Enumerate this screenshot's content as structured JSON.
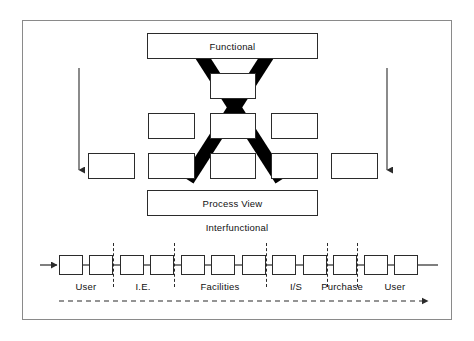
{
  "figure": {
    "type": "diagram",
    "width": 474,
    "height": 341,
    "background_color": "#ffffff",
    "frame_border_color": "#8a8a8a",
    "line_color": "#2b2b2b",
    "cross_out_color": "#000000"
  },
  "top_section": {
    "title_box": {
      "label": "Functional",
      "x": 147,
      "y": 33,
      "width": 171,
      "height": 26
    },
    "hierarchy_rows": [
      {
        "row": 1,
        "boxes": [
          {
            "x": 210,
            "y": 73,
            "width": 46,
            "height": 26
          }
        ]
      },
      {
        "row": 2,
        "boxes": [
          {
            "x": 148,
            "y": 113,
            "width": 47,
            "height": 26
          },
          {
            "x": 210,
            "y": 113,
            "width": 46,
            "height": 26
          },
          {
            "x": 271,
            "y": 113,
            "width": 47,
            "height": 26
          }
        ]
      },
      {
        "row": 3,
        "boxes": [
          {
            "x": 88,
            "y": 153,
            "width": 47,
            "height": 26
          },
          {
            "x": 148,
            "y": 153,
            "width": 47,
            "height": 26
          },
          {
            "x": 210,
            "y": 153,
            "width": 46,
            "height": 26
          },
          {
            "x": 271,
            "y": 153,
            "width": 47,
            "height": 26
          },
          {
            "x": 331,
            "y": 153,
            "width": 47,
            "height": 26
          }
        ]
      }
    ],
    "cross_out": {
      "name": "x-strike-through",
      "stroke_width": 13,
      "color": "#000000",
      "stroke_1": {
        "x1": 190,
        "y1": 40,
        "x2": 280,
        "y2": 179
      },
      "stroke_2": {
        "x1": 278,
        "y1": 40,
        "x2": 188,
        "y2": 179
      }
    },
    "side_arrows": [
      {
        "name": "left-down-arrow",
        "x": 79,
        "y_start": 68,
        "y_end": 176,
        "direction": "down"
      },
      {
        "name": "right-down-arrow",
        "x": 387,
        "y_start": 68,
        "y_end": 176,
        "direction": "down"
      }
    ]
  },
  "middle_section": {
    "process_view_box": {
      "label": "Process View",
      "x": 147,
      "y": 190,
      "width": 171,
      "height": 26
    },
    "caption": {
      "label": "Interfunctional",
      "x": 232,
      "y": 222
    }
  },
  "bottom_section": {
    "entry_arrow": {
      "name": "process-entry-arrow",
      "x_start": 40,
      "x_end": 58,
      "y": 265,
      "direction": "right"
    },
    "exit_line": {
      "x_start": 417,
      "x_end": 438,
      "y": 265
    },
    "chain_boxes": [
      {
        "index": 1,
        "x": 59
      },
      {
        "index": 2,
        "x": 89
      },
      {
        "index": 3,
        "x": 120
      },
      {
        "index": 4,
        "x": 150
      },
      {
        "index": 5,
        "x": 181
      },
      {
        "index": 6,
        "x": 211
      },
      {
        "index": 7,
        "x": 242
      },
      {
        "index": 8,
        "x": 272
      },
      {
        "index": 9,
        "x": 303
      },
      {
        "index": 10,
        "x": 333
      },
      {
        "index": 11,
        "x": 364
      },
      {
        "index": 12,
        "x": 394
      }
    ],
    "connectors": [
      {
        "x_start": 83,
        "x_end": 89
      },
      {
        "x_start": 113,
        "x_end": 120
      },
      {
        "x_start": 144,
        "x_end": 150
      },
      {
        "x_start": 174,
        "x_end": 181
      },
      {
        "x_start": 205,
        "x_end": 211
      },
      {
        "x_start": 235,
        "x_end": 242
      },
      {
        "x_start": 266,
        "x_end": 272
      },
      {
        "x_start": 296,
        "x_end": 303
      },
      {
        "x_start": 327,
        "x_end": 333
      },
      {
        "x_start": 357,
        "x_end": 364
      },
      {
        "x_start": 388,
        "x_end": 394
      }
    ],
    "dividers": [
      {
        "name": "divider-user-ie",
        "x": 113
      },
      {
        "name": "divider-ie-facilities",
        "x": 174
      },
      {
        "name": "divider-facilities-is",
        "x": 266
      },
      {
        "name": "divider-is-purchase",
        "x": 327
      },
      {
        "name": "divider-purchase-user",
        "x": 357
      }
    ],
    "lane_labels": [
      {
        "name": "lane-label-user-left",
        "label": "User",
        "center_x": 86
      },
      {
        "name": "lane-label-ie",
        "label": "I.E.",
        "center_x": 143
      },
      {
        "name": "lane-label-facilities",
        "label": "Facilities",
        "center_x": 220
      },
      {
        "name": "lane-label-is",
        "label": "I/S",
        "center_x": 296
      },
      {
        "name": "lane-label-purchase",
        "label": "Purchase",
        "center_x": 342
      },
      {
        "name": "lane-label-user-right",
        "label": "User",
        "center_x": 395
      }
    ],
    "flow_arrow": {
      "name": "process-flow-arrow",
      "x_start": 59,
      "x_end": 430,
      "y": 301,
      "style": "dashed",
      "direction": "right"
    }
  }
}
